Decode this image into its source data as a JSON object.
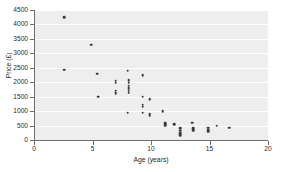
{
  "chart_data": {
    "type": "scatter",
    "title": "",
    "xlabel": "Age (years)",
    "ylabel": "Price (£)",
    "xlim": [
      0,
      20
    ],
    "ylim": [
      0,
      4500
    ],
    "xticks": [
      0,
      5,
      10,
      15,
      20
    ],
    "yticks": [
      0,
      500,
      1000,
      1500,
      2000,
      2500,
      3000,
      3500,
      4000,
      4500
    ],
    "xtick_labels": [
      "0",
      "5",
      "10",
      "15",
      "20"
    ],
    "ytick_labels": [
      "0",
      "500",
      "1000",
      "1500",
      "2000",
      "2500",
      "3000",
      "3500",
      "4000",
      "4500"
    ],
    "grid": "horizontal",
    "legend": "none",
    "marker_color": "#3a3a3a",
    "plot_background": "#eeeeee",
    "gridline_color": "#ffffff",
    "axis_color": "#6e6e6e",
    "series": [
      {
        "name": "Cars",
        "points": [
          [
            2.6,
            4250
          ],
          [
            2.6,
            2440
          ],
          [
            4.9,
            3300
          ],
          [
            5.4,
            2300
          ],
          [
            5.5,
            1500
          ],
          [
            7.0,
            2050
          ],
          [
            7.0,
            1990
          ],
          [
            7.0,
            1700
          ],
          [
            7.0,
            1620
          ],
          [
            8.0,
            2400
          ],
          [
            8.1,
            2080
          ],
          [
            8.1,
            1990
          ],
          [
            8.1,
            1880
          ],
          [
            8.1,
            1790
          ],
          [
            8.1,
            1700
          ],
          [
            8.1,
            1640
          ],
          [
            8.0,
            950
          ],
          [
            9.3,
            2250
          ],
          [
            9.3,
            1500
          ],
          [
            9.3,
            1220
          ],
          [
            9.3,
            1150
          ],
          [
            9.3,
            950
          ],
          [
            9.9,
            1420
          ],
          [
            9.9,
            900
          ],
          [
            9.9,
            840
          ],
          [
            11.0,
            1000
          ],
          [
            11.2,
            580
          ],
          [
            11.2,
            520
          ],
          [
            12.0,
            550
          ],
          [
            12.5,
            400
          ],
          [
            12.5,
            320
          ],
          [
            12.5,
            230
          ],
          [
            12.5,
            170
          ],
          [
            13.5,
            600
          ],
          [
            13.6,
            400
          ],
          [
            13.6,
            340
          ],
          [
            14.9,
            420
          ],
          [
            14.9,
            360
          ],
          [
            14.9,
            300
          ],
          [
            15.6,
            500
          ],
          [
            16.7,
            420
          ]
        ]
      }
    ]
  }
}
